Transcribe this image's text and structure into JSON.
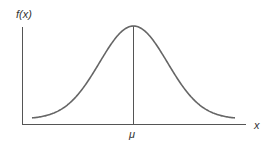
{
  "chart_data": {
    "type": "line",
    "title": "",
    "xlabel": "x",
    "ylabel": "f(x)",
    "x_tick_labels": [
      "μ"
    ],
    "series": [
      {
        "name": "normal density",
        "x": [
          -3,
          -2.5,
          -2,
          -1.5,
          -1,
          -0.5,
          0,
          0.5,
          1,
          1.5,
          2,
          2.5,
          3
        ],
        "values": [
          0.004,
          0.018,
          0.054,
          0.13,
          0.242,
          0.352,
          0.399,
          0.352,
          0.242,
          0.13,
          0.054,
          0.018,
          0.004
        ]
      }
    ],
    "annotations": [
      {
        "type": "vertical-line",
        "at": "μ",
        "label": "μ"
      }
    ],
    "grid": false,
    "legend": "none",
    "colors": {
      "curve": "#666666",
      "axes": "#555555",
      "text": "#333333"
    }
  },
  "labels": {
    "y_axis": "f(x)",
    "x_axis": "x",
    "mean": "μ"
  }
}
